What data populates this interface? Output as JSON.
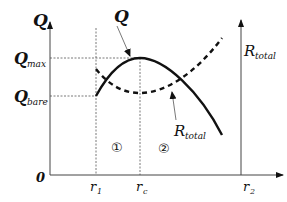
{
  "diagram": {
    "axes": {
      "left_axis_label": "Q",
      "right_axis_label": {
        "main": "R",
        "sub": "total"
      },
      "x_axis_label": {
        "main": "r",
        "sub": "2"
      },
      "origin_label": "0"
    },
    "y_levels": {
      "q_max": {
        "main": "Q",
        "sub": "max"
      },
      "q_bare": {
        "main": "Q",
        "sub": "bare"
      }
    },
    "x_marks": {
      "r1": {
        "main": "r",
        "sub": "1"
      },
      "rc": {
        "main": "r",
        "sub": "c"
      }
    },
    "curves": {
      "q_curve": {
        "label": "Q",
        "style": "solid"
      },
      "r_total_curve": {
        "label": {
          "main": "R",
          "sub": "total"
        },
        "style": "dashed"
      }
    },
    "regions": {
      "region_1": "①",
      "region_2": "②"
    },
    "colors": {
      "line": "#111111",
      "guide": "#555555",
      "background": "#ffffff"
    }
  }
}
